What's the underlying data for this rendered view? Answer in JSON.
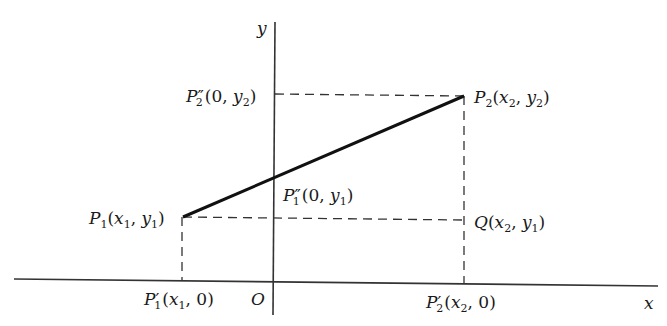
{
  "diagram": {
    "type": "coordinate-geometry",
    "axes": {
      "x_label": "x",
      "y_label": "y",
      "origin_label": "O"
    },
    "points": [
      {
        "id": "P1",
        "label": "P",
        "sub": "1",
        "primes": "",
        "coords": "(x₁, y₁)",
        "coord_parts": [
          "x",
          "1",
          "y",
          "1"
        ]
      },
      {
        "id": "P2",
        "label": "P",
        "sub": "2",
        "primes": "",
        "coords": "(x₂, y₂)"
      },
      {
        "id": "P1prime",
        "label": "P",
        "sub": "1",
        "primes": "′",
        "coords": "(x₁, 0)"
      },
      {
        "id": "P2prime",
        "label": "P",
        "sub": "2",
        "primes": "′",
        "coords": "(x₂, 0)"
      },
      {
        "id": "P1dprime",
        "label": "P",
        "sub": "1",
        "primes": "″",
        "coords": "(0, y₁)"
      },
      {
        "id": "P2dprime",
        "label": "P",
        "sub": "2",
        "primes": "″",
        "coords": "(0, y₂)"
      },
      {
        "id": "Q",
        "label": "Q",
        "sub": "",
        "primes": "",
        "coords": "(x₂, y₁)"
      }
    ],
    "segments": [
      {
        "from": "P1",
        "to": "P2",
        "style": "solid-bold"
      },
      {
        "from": "P1",
        "to": "P1prime",
        "style": "dashed"
      },
      {
        "from": "P1",
        "to": "Q",
        "style": "dashed"
      },
      {
        "from": "P2",
        "to": "P2dprime",
        "style": "dashed"
      },
      {
        "from": "P2",
        "to": "P2prime",
        "style": "dashed"
      }
    ],
    "labels": {
      "y_axis": "y",
      "x_axis": "x",
      "origin": "O",
      "p2dprime_letter": "P",
      "p2dprime_primes": "″",
      "p2dprime_sub": "2",
      "p2dprime_open": "(0, ",
      "p2dprime_y": "y",
      "p2dprime_ysub": "2",
      "p2dprime_close": ")",
      "p2_letter": "P",
      "p2_sub": "2",
      "p2_open": "(",
      "p2_x": "x",
      "p2_xsub": "2",
      "p2_comma": ", ",
      "p2_y": "y",
      "p2_ysub": "2",
      "p2_close": ")",
      "p1dprime_letter": "P",
      "p1dprime_primes": "″",
      "p1dprime_sub": "1",
      "p1dprime_open": "(0, ",
      "p1dprime_y": "y",
      "p1dprime_ysub": "1",
      "p1dprime_close": ")",
      "p1_letter": "P",
      "p1_sub": "1",
      "p1_open": "(",
      "p1_x": "x",
      "p1_xsub": "1",
      "p1_comma": ", ",
      "p1_y": "y",
      "p1_ysub": "1",
      "p1_close": ")",
      "q_letter": "Q",
      "q_open": "(",
      "q_x": "x",
      "q_xsub": "2",
      "q_comma": ", ",
      "q_y": "y",
      "q_ysub": "1",
      "q_close": ")",
      "p1prime_letter": "P",
      "p1prime_primes": "′",
      "p1prime_sub": "1",
      "p1prime_open": "(",
      "p1prime_x": "x",
      "p1prime_xsub": "1",
      "p1prime_rest": ", 0)",
      "p2prime_letter": "P",
      "p2prime_primes": "′",
      "p2prime_sub": "2",
      "p2prime_open": "(",
      "p2prime_x": "x",
      "p2prime_xsub": "2",
      "p2prime_rest": ", 0)"
    }
  }
}
